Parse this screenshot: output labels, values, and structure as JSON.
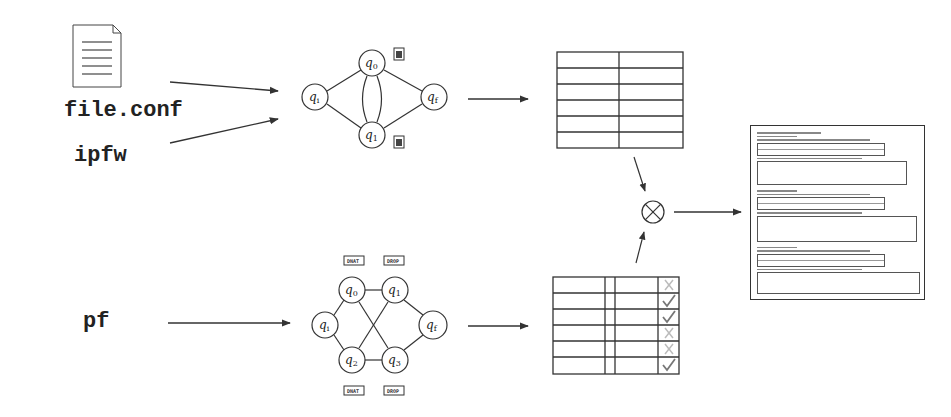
{
  "inputs": {
    "file_icon": "document-icon",
    "file_label": "file.conf",
    "ipfw_label": "ipfw",
    "pf_label": "pf"
  },
  "top_graph": {
    "nodes": [
      {
        "id": "qi",
        "base": "q",
        "sub": "i"
      },
      {
        "id": "q0",
        "base": "q",
        "sub": "0"
      },
      {
        "id": "q1",
        "base": "q",
        "sub": "1"
      },
      {
        "id": "qf",
        "base": "q",
        "sub": "f"
      }
    ],
    "annotations": [
      "document-icon",
      "document-icon"
    ]
  },
  "bottom_graph": {
    "nodes": [
      {
        "id": "qi",
        "base": "q",
        "sub": "i"
      },
      {
        "id": "q0",
        "base": "q",
        "sub": "0"
      },
      {
        "id": "q1",
        "base": "q",
        "sub": "1"
      },
      {
        "id": "q2",
        "base": "q",
        "sub": "2"
      },
      {
        "id": "q3",
        "base": "q",
        "sub": "3"
      },
      {
        "id": "qf",
        "base": "q",
        "sub": "f"
      }
    ],
    "tags_top": [
      "DNAT",
      "DROP"
    ],
    "tags_bottom": [
      "DNAT",
      "DROP"
    ]
  },
  "top_table": {
    "rows": 6,
    "cols": 2
  },
  "bottom_table": {
    "rows": 6,
    "marks": [
      "cross",
      "check",
      "check",
      "cross",
      "cross",
      "check"
    ]
  },
  "combine_operator": "⊗",
  "output": {
    "type": "report-document"
  },
  "colors": {
    "stroke": "#333333",
    "mark_check": "#777777",
    "mark_cross": "#bbbbbb"
  }
}
